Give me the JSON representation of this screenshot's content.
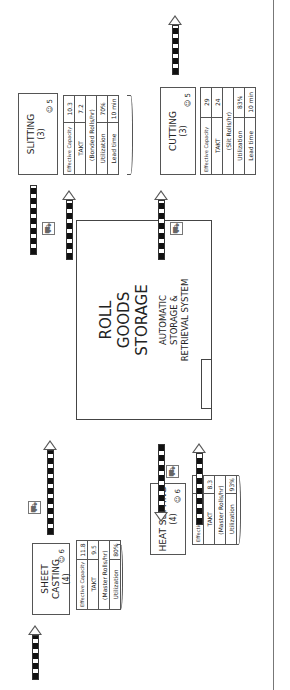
{
  "processes": [
    {
      "id": "sheet-casting",
      "title": "SHEET CASTING",
      "count": "(4)",
      "operators": "6",
      "rows": [
        [
          "Effective Capacity",
          "11.8"
        ],
        [
          "TAKT",
          "9.5"
        ],
        [
          "(Master Rolls/hr)",
          ""
        ],
        [
          "Utilization",
          "80%"
        ]
      ]
    },
    {
      "id": "heat-setting",
      "title": "HEAT SETTING",
      "count": "(4)",
      "operators": "6",
      "rows": [
        [
          "Effective Capacity",
          "8.9"
        ],
        [
          "TAKT",
          "8.3"
        ],
        [
          "(Master Rolls/hr)",
          ""
        ],
        [
          "Utilization",
          "93%"
        ]
      ]
    },
    {
      "id": "slitting",
      "title": "SLITTING",
      "count": "(3)",
      "operators": "5",
      "rows": [
        [
          "Effective Capacity",
          "10.3"
        ],
        [
          "TAKT",
          "7.2"
        ],
        [
          "(Bonded Rolls/hr)",
          ""
        ],
        [
          "Utilization",
          "70%"
        ],
        [
          "Lead time",
          "10 min"
        ]
      ]
    },
    {
      "id": "cutting",
      "title": "CUTTING",
      "count": "(3)",
      "operators": "5",
      "rows": [
        [
          "Effective Capacity",
          "29"
        ],
        [
          "TAKT",
          "24"
        ],
        [
          "(Slit Rolls/hr)",
          ""
        ],
        [
          "Utilization",
          "83%"
        ],
        [
          "Lead time",
          "10 min"
        ]
      ]
    }
  ],
  "storage": {
    "title_lines": [
      "ROLL",
      "GOODS",
      "STORAGE"
    ],
    "subtitle_lines": [
      "AUTOMATIC",
      "STORAGE &",
      "RETRIEVAL SYSTEM"
    ]
  },
  "icons": {
    "operator": "operator-icon",
    "forklift": "forklift-icon",
    "push_arrow": "push-arrow-icon"
  }
}
